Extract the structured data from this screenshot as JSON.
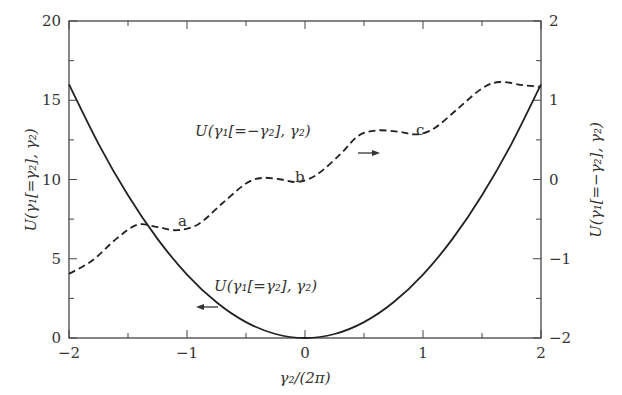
{
  "chart_data": {
    "type": "line",
    "title": "",
    "xlabel": "γ₂/(2π)",
    "ylabel_left": "U(γ₁[=γ₂], γ₂)",
    "ylabel_right": "U(γ₁[=−γ₂], γ₂)",
    "xlim": [
      -2,
      2
    ],
    "ylim_left": [
      0,
      20
    ],
    "ylim_right": [
      -2,
      2
    ],
    "grid": false,
    "x_ticks": [
      "−2",
      "−1",
      "0",
      "1",
      "2"
    ],
    "x_tick_values": [
      -2,
      -1,
      0,
      1,
      2
    ],
    "y_left_ticks": [
      "0",
      "5",
      "10",
      "15",
      "20"
    ],
    "y_left_tick_values": [
      0,
      5,
      10,
      15,
      20
    ],
    "y_right_ticks": [
      "−2",
      "−1",
      "0",
      "1",
      "2"
    ],
    "y_right_tick_values": [
      -2,
      -1,
      0,
      1,
      2
    ],
    "series": [
      {
        "name": "U(γ₁[=γ₂], γ₂)",
        "axis": "left",
        "style": "solid",
        "x": [
          -2,
          -1.75,
          -1.5,
          -1.25,
          -1,
          -0.75,
          -0.5,
          -0.25,
          0,
          0.25,
          0.5,
          0.75,
          1,
          1.25,
          1.5,
          1.75,
          2
        ],
        "y": [
          16,
          12.25,
          9,
          6.25,
          4,
          2.25,
          1,
          0.25,
          0,
          0.25,
          1,
          2.25,
          4,
          6.25,
          9,
          12.25,
          16
        ]
      },
      {
        "name": "U(γ₁[=−γ₂], γ₂)",
        "axis": "right",
        "style": "dashed",
        "x": [
          -2,
          -1.8,
          -1.6,
          -1.42,
          -1.25,
          -1.08,
          -0.9,
          -0.7,
          -0.5,
          -0.36,
          -0.2,
          -0.06,
          0.1,
          0.3,
          0.45,
          0.61,
          0.8,
          0.95,
          1.1,
          1.3,
          1.5,
          1.65,
          1.85,
          2
        ],
        "y": [
          -1.19,
          -1.02,
          -0.75,
          -0.57,
          -0.6,
          -0.64,
          -0.56,
          -0.3,
          -0.05,
          0.02,
          0.0,
          -0.03,
          0.06,
          0.32,
          0.55,
          0.62,
          0.6,
          0.57,
          0.65,
          0.9,
          1.15,
          1.23,
          1.19,
          1.17
        ]
      }
    ],
    "annotations": {
      "a": "a",
      "b": "b",
      "c": "c",
      "label_upper": "U(γ₁[=−γ₂], γ₂)",
      "label_lower": "U(γ₁[=γ₂], γ₂)",
      "arrow_upper": "→",
      "arrow_lower": "←"
    }
  }
}
